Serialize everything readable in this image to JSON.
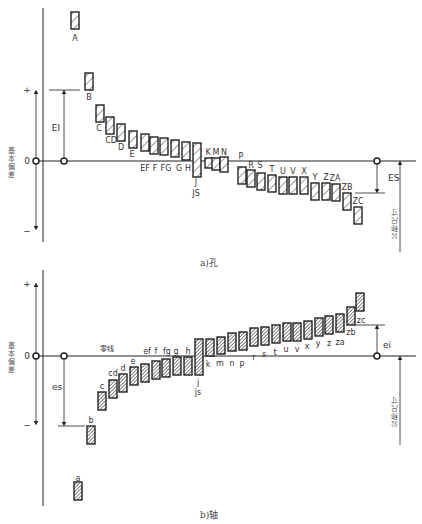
{
  "colors": {
    "line": "#222222",
    "text": "#333333",
    "hatch_light": "#ffffff",
    "hatch_dark": "#555555"
  },
  "hole": {
    "caption": "a)孔",
    "zero_label": "0",
    "plus_label": "+",
    "minus_label": "−",
    "axis_label": "基本偏差",
    "deviation_label": "EI",
    "deviation_label_right": "ES",
    "basic_size_label": "公称尺寸",
    "bars": [
      {
        "label": "A",
        "x": 71,
        "top": 12,
        "h": 17,
        "lx": 75,
        "ly": 41
      },
      {
        "label": "B",
        "x": 85,
        "top": 73,
        "h": 17,
        "lx": 89,
        "ly": 100
      },
      {
        "label": "C",
        "x": 96,
        "top": 105,
        "h": 17,
        "lx": 99,
        "ly": 131
      },
      {
        "label": "CD",
        "x": 106,
        "top": 117,
        "h": 17,
        "lx": 111,
        "ly": 143
      },
      {
        "label": "D",
        "x": 117,
        "top": 124,
        "h": 17,
        "lx": 121,
        "ly": 150
      },
      {
        "label": "E",
        "x": 129,
        "top": 131,
        "h": 17,
        "lx": 132,
        "ly": 157
      },
      {
        "label": "EF",
        "x": 141,
        "top": 134,
        "h": 17,
        "lx": 145,
        "ly": 171
      },
      {
        "label": "F",
        "x": 150,
        "top": 137,
        "h": 17,
        "lx": 155,
        "ly": 171
      },
      {
        "label": "FG",
        "x": 160,
        "top": 138,
        "h": 17,
        "lx": 166,
        "ly": 171
      },
      {
        "label": "G",
        "x": 171,
        "top": 140,
        "h": 17,
        "lx": 179,
        "ly": 171
      },
      {
        "label": "H",
        "x": 182,
        "top": 142,
        "h": 18,
        "lx": 188,
        "ly": 171
      },
      {
        "label": "JS",
        "x": 193,
        "top": 143,
        "h": 34,
        "lx": 196,
        "ly": 196
      },
      {
        "label": "K",
        "x": 205,
        "top": 158,
        "h": 10,
        "lx": 208,
        "ly": 155
      },
      {
        "label": "M",
        "x": 212,
        "top": 158,
        "h": 12,
        "lx": 216,
        "ly": 155
      },
      {
        "label": "N",
        "x": 220,
        "top": 157,
        "h": 15,
        "lx": 224,
        "ly": 155
      },
      {
        "label": "P",
        "x": 238,
        "top": 167,
        "h": 17,
        "lx": 241,
        "ly": 159
      },
      {
        "label": "R",
        "x": 247,
        "top": 170,
        "h": 17,
        "lx": 251,
        "ly": 168
      },
      {
        "label": "S",
        "x": 257,
        "top": 173,
        "h": 17,
        "lx": 260,
        "ly": 168
      },
      {
        "label": "T",
        "x": 268,
        "top": 175,
        "h": 17,
        "lx": 272,
        "ly": 172
      },
      {
        "label": "U",
        "x": 279,
        "top": 177,
        "h": 17,
        "lx": 283,
        "ly": 174
      },
      {
        "label": "V",
        "x": 289,
        "top": 177,
        "h": 17,
        "lx": 293,
        "ly": 174
      },
      {
        "label": "X",
        "x": 300,
        "top": 177,
        "h": 17,
        "lx": 304,
        "ly": 174
      },
      {
        "label": "Y",
        "x": 311,
        "top": 183,
        "h": 17,
        "lx": 315,
        "ly": 180
      },
      {
        "label": "Z",
        "x": 322,
        "top": 183,
        "h": 17,
        "lx": 326,
        "ly": 180
      },
      {
        "label": "ZA",
        "x": 332,
        "top": 184,
        "h": 17,
        "lx": 335,
        "ly": 181
      },
      {
        "label": "ZB",
        "x": 343,
        "top": 193,
        "h": 17,
        "lx": 347,
        "ly": 190
      },
      {
        "label": "ZC",
        "x": 354,
        "top": 207,
        "h": 17,
        "lx": 358,
        "ly": 204
      }
    ],
    "extra_labels": [
      {
        "text": "J",
        "x": 196,
        "y": 185
      }
    ]
  },
  "shaft": {
    "caption": "b)轴",
    "zero_label": "0",
    "plus_label": "+",
    "minus_label": "−",
    "axis_label": "基本偏差",
    "zero_line_label": "零线",
    "deviation_label": "es",
    "deviation_label_right": "ei",
    "basic_size_label": "公称尺寸",
    "bars": [
      {
        "label": "a",
        "x": 74,
        "top": 482,
        "h": 18,
        "lx": 78,
        "ly": 481
      },
      {
        "label": "b",
        "x": 87,
        "top": 426,
        "h": 18,
        "lx": 91,
        "ly": 423
      },
      {
        "label": "c",
        "x": 98,
        "top": 392,
        "h": 18,
        "lx": 102,
        "ly": 389
      },
      {
        "label": "cd",
        "x": 109,
        "top": 380,
        "h": 18,
        "lx": 113,
        "ly": 376
      },
      {
        "label": "d",
        "x": 119,
        "top": 374,
        "h": 18,
        "lx": 123,
        "ly": 371
      },
      {
        "label": "e",
        "x": 130,
        "top": 367,
        "h": 18,
        "lx": 133,
        "ly": 364
      },
      {
        "label": "ef",
        "x": 141,
        "top": 364,
        "h": 18,
        "lx": 147,
        "ly": 354
      },
      {
        "label": "f",
        "x": 152,
        "top": 361,
        "h": 18,
        "lx": 156,
        "ly": 354
      },
      {
        "label": "fg",
        "x": 162,
        "top": 359,
        "h": 18,
        "lx": 167,
        "ly": 354
      },
      {
        "label": "g",
        "x": 173,
        "top": 357,
        "h": 18,
        "lx": 176,
        "ly": 354
      },
      {
        "label": "h",
        "x": 184,
        "top": 357,
        "h": 18,
        "lx": 188,
        "ly": 354
      },
      {
        "label": "js",
        "x": 195,
        "top": 339,
        "h": 36,
        "lx": 198,
        "ly": 395
      },
      {
        "label": "k",
        "x": 206,
        "top": 339,
        "h": 17,
        "lx": 208,
        "ly": 367
      },
      {
        "label": "m",
        "x": 217,
        "top": 337,
        "h": 17,
        "lx": 220,
        "ly": 366
      },
      {
        "label": "n",
        "x": 228,
        "top": 333,
        "h": 18,
        "lx": 232,
        "ly": 366
      },
      {
        "label": "p",
        "x": 239,
        "top": 332,
        "h": 18,
        "lx": 242,
        "ly": 366
      },
      {
        "label": "r",
        "x": 250,
        "top": 328,
        "h": 18,
        "lx": 254,
        "ly": 360
      },
      {
        "label": "s",
        "x": 261,
        "top": 327,
        "h": 18,
        "lx": 264,
        "ly": 357
      },
      {
        "label": "t",
        "x": 272,
        "top": 325,
        "h": 18,
        "lx": 275,
        "ly": 355
      },
      {
        "label": "u",
        "x": 283,
        "top": 323,
        "h": 18,
        "lx": 286,
        "ly": 352
      },
      {
        "label": "v",
        "x": 293,
        "top": 323,
        "h": 18,
        "lx": 297,
        "ly": 352
      },
      {
        "label": "x",
        "x": 304,
        "top": 321,
        "h": 18,
        "lx": 307,
        "ly": 349
      },
      {
        "label": "y",
        "x": 315,
        "top": 318,
        "h": 18,
        "lx": 318,
        "ly": 346
      },
      {
        "label": "z",
        "x": 325,
        "top": 316,
        "h": 18,
        "lx": 329,
        "ly": 346
      },
      {
        "label": "za",
        "x": 336,
        "top": 314,
        "h": 18,
        "lx": 340,
        "ly": 345
      },
      {
        "label": "zb",
        "x": 347,
        "top": 307,
        "h": 18,
        "lx": 351,
        "ly": 335
      },
      {
        "label": "zc",
        "x": 356,
        "top": 293,
        "h": 18,
        "lx": 361,
        "ly": 323
      }
    ],
    "extra_labels": [
      {
        "text": "j",
        "x": 198,
        "y": 385
      }
    ]
  }
}
